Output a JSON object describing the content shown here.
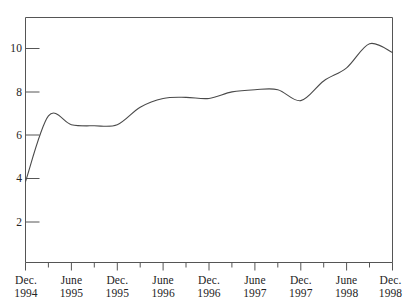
{
  "chart_data": {
    "type": "line",
    "title": "",
    "subtitle": "",
    "xlabel": "",
    "ylabel": "",
    "grid": false,
    "legend": "none",
    "line_color": "#4a4a4a",
    "frame_color": "#555555",
    "background": "#ffffff",
    "ylim": [
      0,
      11.2
    ],
    "y_ticks": [
      2,
      4,
      6,
      8,
      10
    ],
    "y_tick_labels": [
      "2",
      "4",
      "6",
      "8",
      "10"
    ],
    "x_major_labels": [
      {
        "month": "Dec.",
        "year": "1994"
      },
      {
        "month": "June",
        "year": "1995"
      },
      {
        "month": "Dec.",
        "year": "1995"
      },
      {
        "month": "June",
        "year": "1996"
      },
      {
        "month": "Dec.",
        "year": "1996"
      },
      {
        "month": "June",
        "year": "1997"
      },
      {
        "month": "Dec.",
        "year": "1997"
      },
      {
        "month": "June",
        "year": "1998"
      },
      {
        "month": "Dec.",
        "year": "1998"
      }
    ],
    "x_minor_count_between_majors": 1,
    "x": [
      "Dec. 1994",
      "Mar. 1995",
      "June 1995",
      "Sept. 1995",
      "Dec. 1995",
      "Mar. 1996",
      "June 1996",
      "Sept. 1996",
      "Dec. 1996",
      "Mar. 1997",
      "June 1997",
      "Sept. 1997",
      "Dec. 1997",
      "Mar. 1998",
      "June 1998",
      "Sept. 1998",
      "Dec. 1998"
    ],
    "values": [
      3.7,
      6.7,
      6.3,
      6.25,
      6.3,
      7.1,
      7.5,
      7.55,
      7.5,
      7.8,
      7.9,
      7.9,
      7.4,
      8.3,
      8.9,
      10.0,
      9.6
    ],
    "series": [
      {
        "name": "series-1",
        "values": [
          3.7,
          6.7,
          6.3,
          6.25,
          6.3,
          7.1,
          7.5,
          7.55,
          7.5,
          7.8,
          7.9,
          7.9,
          7.4,
          8.3,
          8.9,
          10.0,
          9.6
        ]
      }
    ],
    "annotations": []
  }
}
